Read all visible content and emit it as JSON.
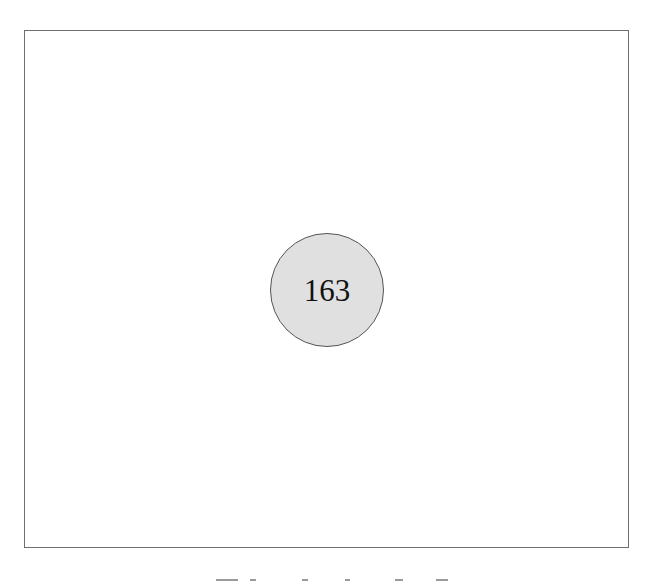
{
  "figure": {
    "frame": {
      "border_color": "#6e6e6e",
      "background": "#ffffff"
    },
    "node": {
      "label": "163",
      "fill_color": "#e0e0e0",
      "stroke_color": "#555555",
      "shape": "circle"
    },
    "caption": {
      "visible": "cropped",
      "text": null
    }
  }
}
